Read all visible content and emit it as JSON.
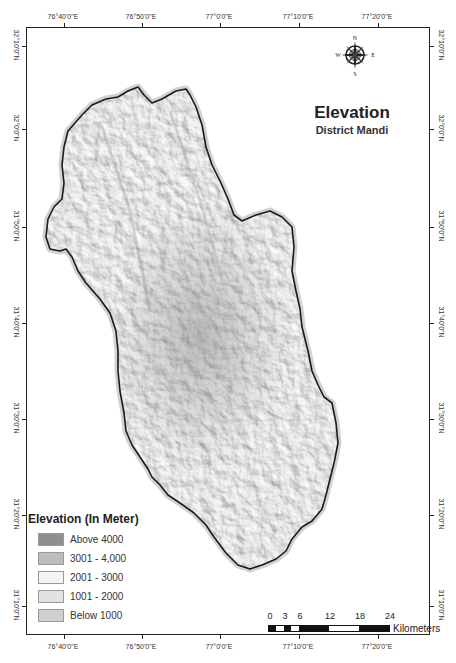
{
  "map": {
    "title": "Elevation",
    "subtitle": "District Mandi",
    "compass": {
      "n": "N",
      "s": "S",
      "e": "E",
      "w": "W",
      "icon": "compass-rose-icon"
    },
    "lon_labels": [
      "76°40'0\"E",
      "76°50'0\"E",
      "77°0'0\"E",
      "77°10'0\"E",
      "77°20'0\"E"
    ],
    "lat_labels": [
      "32°10'0\"N",
      "32°0'0\"N",
      "31°50'0\"N",
      "31°40'0\"N",
      "31°30'0\"N",
      "31°20'0\"N",
      "31°10'0\"N"
    ],
    "legend": {
      "title": "Elevation (In Meter)",
      "items": [
        {
          "label": "Above 4000",
          "color": "#8f8f8f"
        },
        {
          "label": "3001 - 4,000",
          "color": "#bdbdbd"
        },
        {
          "label": "2001 - 3000",
          "color": "#f4f4f4"
        },
        {
          "label": "1001 - 2000",
          "color": "#e2e2e2"
        },
        {
          "label": "Below 1000",
          "color": "#cfcfcf"
        }
      ]
    },
    "scale": {
      "ticks": [
        "0",
        "3",
        "6",
        "12",
        "18",
        "24"
      ],
      "unit": "Kilometers"
    }
  }
}
